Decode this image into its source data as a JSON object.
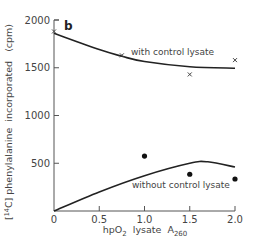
{
  "chart_data": {
    "type": "line",
    "panel_label": "b",
    "title": "",
    "xlabel": "hpO2 lysate A260",
    "xlabel_parts": {
      "main": "hpO",
      "sub1": "2",
      "mid": "  lysate  A",
      "sub2": "260"
    },
    "ylabel": "[14C] phenylalanine incorporated (cpm)",
    "ylabel_parts": {
      "open": "[",
      "sup": "14",
      "element": "C]",
      "rest": " phenylalanine  incorporated   (cpm)"
    },
    "xlim": [
      0,
      2.0
    ],
    "ylim": [
      0,
      2000
    ],
    "x_ticks": [
      0,
      0.5,
      1.0,
      1.5,
      2.0
    ],
    "x_tick_labels": [
      "0",
      "0.5",
      "1.0",
      "1.5",
      "2.0"
    ],
    "y_ticks": [
      0,
      500,
      1000,
      1500,
      2000
    ],
    "y_tick_labels": [
      "0",
      "500",
      "1000",
      "1500",
      "2000"
    ],
    "grid": false,
    "legend": "inline annotations",
    "series": [
      {
        "name": "with control lysate",
        "marker": "x",
        "points": [
          {
            "x": 0,
            "y": 1880
          },
          {
            "x": 0.75,
            "y": 1630
          },
          {
            "x": 1.5,
            "y": 1430
          },
          {
            "x": 2.0,
            "y": 1580
          }
        ],
        "fit_curve": [
          {
            "x": 0,
            "y": 1860
          },
          {
            "x": 0.5,
            "y": 1690
          },
          {
            "x": 0.75,
            "y": 1620
          },
          {
            "x": 1.0,
            "y": 1565
          },
          {
            "x": 1.5,
            "y": 1510
          },
          {
            "x": 2.0,
            "y": 1495
          }
        ]
      },
      {
        "name": "without control lysate",
        "marker": "filled-circle",
        "points": [
          {
            "x": 1.0,
            "y": 575
          },
          {
            "x": 1.5,
            "y": 385
          },
          {
            "x": 2.0,
            "y": 335
          }
        ],
        "fit_curve": [
          {
            "x": 0,
            "y": 0
          },
          {
            "x": 0.5,
            "y": 200
          },
          {
            "x": 1.0,
            "y": 370
          },
          {
            "x": 1.5,
            "y": 500
          },
          {
            "x": 1.7,
            "y": 515
          },
          {
            "x": 2.0,
            "y": 460
          }
        ]
      }
    ],
    "annotations": [
      "with control lysate",
      "without control lysate"
    ]
  }
}
